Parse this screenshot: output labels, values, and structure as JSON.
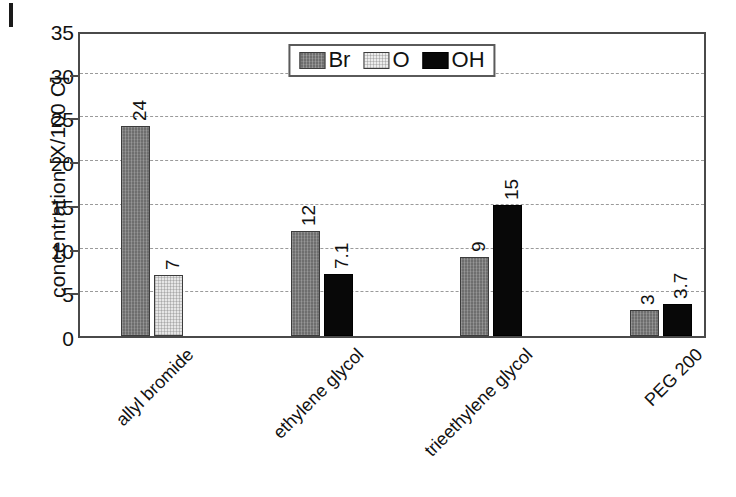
{
  "chart_data": {
    "type": "bar",
    "title": "",
    "xlabel": "",
    "ylabel": "concentration [X/100 C]",
    "ylim": [
      0,
      35
    ],
    "yticks": [
      0,
      5,
      10,
      15,
      20,
      25,
      30,
      35
    ],
    "gridlines": [
      5,
      10,
      15,
      20,
      25,
      30
    ],
    "grid": true,
    "legend_position": "upper center",
    "categories": [
      "allyl bromide",
      "ethylene glycol",
      "trieethylene glycol",
      "PEG 200"
    ],
    "series": [
      {
        "name": "Br",
        "color": "#6e6e6e",
        "values": [
          24,
          12,
          9,
          3
        ],
        "labels": [
          "24",
          "12",
          "9",
          "3"
        ]
      },
      {
        "name": "O",
        "color": "#e6e6e6",
        "values": [
          7,
          null,
          null,
          null
        ],
        "labels": [
          "7",
          "",
          "",
          ""
        ]
      },
      {
        "name": "OH",
        "color": "#080808",
        "values": [
          null,
          7.1,
          15,
          3.7
        ],
        "labels": [
          "",
          "7.1",
          "15",
          "3.7"
        ]
      }
    ],
    "bars": [
      {
        "group": "allyl bromide",
        "series": "Br",
        "value": 24,
        "label": "24"
      },
      {
        "group": "allyl bromide",
        "series": "O",
        "value": 7,
        "label": "7"
      },
      {
        "group": "ethylene glycol",
        "series": "Br",
        "value": 12,
        "label": "12"
      },
      {
        "group": "ethylene glycol",
        "series": "OH",
        "value": 7.1,
        "label": "7.1"
      },
      {
        "group": "trieethylene glycol",
        "series": "Br",
        "value": 9,
        "label": "9"
      },
      {
        "group": "trieethylene glycol",
        "series": "OH",
        "value": 15,
        "label": "15"
      },
      {
        "group": "PEG 200",
        "series": "Br",
        "value": 3,
        "label": "3"
      },
      {
        "group": "PEG 200",
        "series": "OH",
        "value": 3.7,
        "label": "3.7"
      }
    ]
  },
  "axes": {
    "y_title": "concentration [X/100 C]",
    "y_tick_labels": [
      "35",
      "30",
      "25",
      "20",
      "15",
      "10",
      "5",
      "0"
    ],
    "x_tick_labels": [
      "allyl bromide",
      "ethylene glycol",
      "trieethylene glycol",
      "PEG 200"
    ]
  },
  "legend": {
    "items": [
      {
        "label": "Br",
        "swatch": "br"
      },
      {
        "label": "O",
        "swatch": "o"
      },
      {
        "label": "OH",
        "swatch": "oh"
      }
    ]
  },
  "colors": {
    "br": "#6e6e6e",
    "o": "#e6e6e6",
    "oh": "#080808",
    "frame": "#4a4a4a",
    "grid": "#9a9a9a",
    "text": "#111111",
    "background": "#ffffff"
  }
}
